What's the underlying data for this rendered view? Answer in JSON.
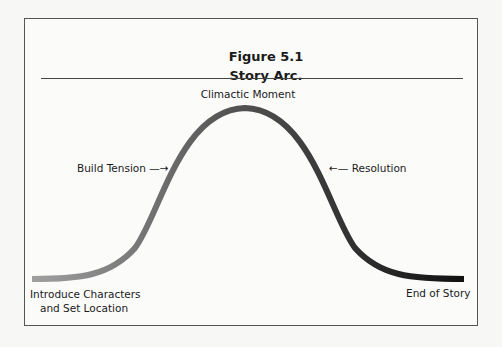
{
  "figure": {
    "number": "Figure 5.1",
    "title": "Story Arc."
  },
  "labels": {
    "climax": "Climactic Moment",
    "build": "Build Tension",
    "resolution": "Resolution",
    "start_line1": "Introduce Characters",
    "start_line2": "and Set Location",
    "end": "End of Story"
  },
  "arrows": {
    "right": "—→",
    "left": "←—"
  },
  "colors": {
    "curve_start": "#9a9a9a",
    "curve_end": "#111111",
    "frame": "#555555"
  }
}
